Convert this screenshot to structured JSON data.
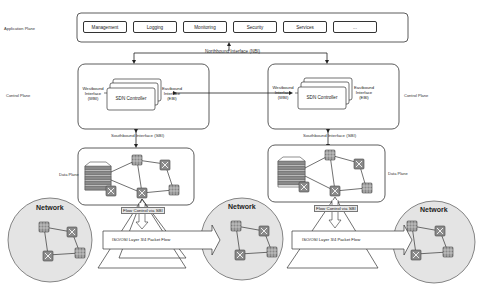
{
  "diagram": {
    "application_plane": {
      "label": "Application Plane",
      "apps": [
        "Management",
        "Logging",
        "Monitoring",
        "Security",
        "Services",
        "..."
      ]
    },
    "northbound_label": "Northbound Interface (NBI)",
    "control_planes": [
      {
        "label": "Control Plane",
        "westbound": [
          "Westbound",
          "Interface",
          "(WBI)"
        ],
        "eastbound": [
          "Eastbound",
          "Interface",
          "(EBI)"
        ],
        "controller": "SDN Controller",
        "southbound_label": "Southbound Interface (SBI)"
      },
      {
        "label": "Control Plane",
        "westbound": [
          "Westbound",
          "Interface",
          "(WBI)"
        ],
        "eastbound": [
          "Eastbound",
          "Interface",
          "(EBI)"
        ],
        "controller": "SDN Controller",
        "southbound_label": "Southbound Interface (SBI)"
      }
    ],
    "data_planes": [
      {
        "label": "Data Plane",
        "flow_control": "Flow Control via SBI"
      },
      {
        "label": "Data Plane",
        "flow_control": "Flow Control via SBI"
      }
    ],
    "networks": [
      {
        "label": "Network"
      },
      {
        "label": "Network"
      },
      {
        "label": "Network"
      }
    ],
    "packet_flow_label": "ISO/OSI Layer 3/4 Packet Flow",
    "colors": {
      "stroke": "#333333",
      "network_fill": "#e4e4e4",
      "node_fill": "#8a8a8a",
      "background": "#ffffff"
    }
  }
}
